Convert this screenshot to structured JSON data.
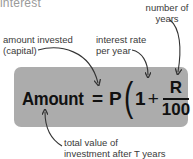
{
  "heading": "interest",
  "labels": {
    "years": "number of years",
    "years_line1": "number of",
    "years_line2": "years",
    "capital_line1": "amount invested",
    "capital_line2": "(capital)",
    "rate_line1": "interest rate",
    "rate_line2": "per year",
    "total_line1": "total value of",
    "total_line2": "investment after T years"
  },
  "formula": {
    "lhs": "Amount",
    "equals": "=",
    "principal": "P",
    "open_paren": "(",
    "one": "1",
    "plus": "+",
    "numerator": "R",
    "denominator": "100",
    "close_paren": ")",
    "exponent": "T"
  },
  "colors": {
    "box": "#acacac",
    "text": "#111111",
    "label": "#3a3a3a",
    "heading": "#9a9a9a"
  }
}
